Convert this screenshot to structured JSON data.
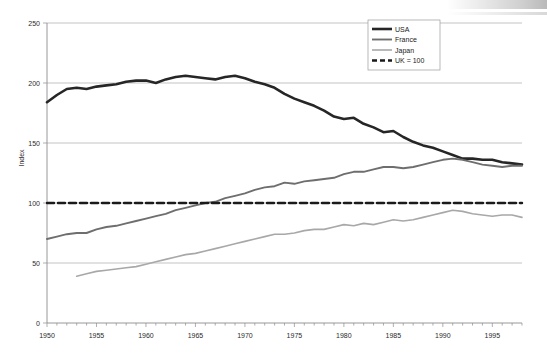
{
  "chart_data": {
    "type": "line",
    "title": "",
    "xlabel": "",
    "ylabel": "Index",
    "xlim": [
      1950,
      1998
    ],
    "ylim": [
      0,
      250
    ],
    "grid": true,
    "y_ticks": [
      0,
      50,
      100,
      150,
      200,
      250
    ],
    "x_ticks": [
      1950,
      1955,
      1960,
      1965,
      1970,
      1975,
      1980,
      1985,
      1990,
      1995
    ],
    "x_tick_interval_minor": 1,
    "legend_position": "top-right",
    "legend": [
      "USA",
      "France",
      "Japan",
      "UK = 100"
    ],
    "series": [
      {
        "name": "USA",
        "color": "#262626",
        "width": 2.6,
        "dash": "none",
        "x": [
          1950,
          1951,
          1952,
          1953,
          1954,
          1955,
          1956,
          1957,
          1958,
          1959,
          1960,
          1961,
          1962,
          1963,
          1964,
          1965,
          1966,
          1967,
          1968,
          1969,
          1970,
          1971,
          1972,
          1973,
          1974,
          1975,
          1976,
          1977,
          1978,
          1979,
          1980,
          1981,
          1982,
          1983,
          1984,
          1985,
          1986,
          1987,
          1988,
          1989,
          1990,
          1991,
          1992,
          1993,
          1994,
          1995,
          1996,
          1997,
          1998
        ],
        "values": [
          184,
          190,
          195,
          196,
          195,
          197,
          198,
          199,
          201,
          202,
          202,
          200,
          203,
          205,
          206,
          205,
          204,
          203,
          205,
          206,
          204,
          201,
          199,
          196,
          191,
          187,
          184,
          181,
          177,
          172,
          170,
          171,
          166,
          163,
          159,
          160,
          155,
          151,
          148,
          146,
          143,
          140,
          137,
          137,
          136,
          136,
          134,
          133,
          132
        ],
        "y_note": "index with UK = 100"
      },
      {
        "name": "France",
        "color": "#6e6e6e",
        "width": 1.9,
        "dash": "none",
        "x": [
          1950,
          1951,
          1952,
          1953,
          1954,
          1955,
          1956,
          1957,
          1958,
          1959,
          1960,
          1961,
          1962,
          1963,
          1964,
          1965,
          1966,
          1967,
          1968,
          1969,
          1970,
          1971,
          1972,
          1973,
          1974,
          1975,
          1976,
          1977,
          1978,
          1979,
          1980,
          1981,
          1982,
          1983,
          1984,
          1985,
          1986,
          1987,
          1988,
          1989,
          1990,
          1991,
          1992,
          1993,
          1994,
          1995,
          1996,
          1997,
          1998
        ],
        "values": [
          70,
          72,
          74,
          75,
          75,
          78,
          80,
          81,
          83,
          85,
          87,
          89,
          91,
          94,
          96,
          98,
          100,
          101,
          104,
          106,
          108,
          111,
          113,
          114,
          117,
          116,
          118,
          119,
          120,
          121,
          124,
          126,
          126,
          128,
          130,
          130,
          129,
          130,
          132,
          134,
          136,
          137,
          136,
          134,
          132,
          131,
          130,
          131,
          131
        ],
        "y_note": "index with UK = 100"
      },
      {
        "name": "Japan",
        "color": "#a8a8a8",
        "width": 1.6,
        "dash": "none",
        "x": [
          1953,
          1954,
          1955,
          1956,
          1957,
          1958,
          1959,
          1960,
          1961,
          1962,
          1963,
          1964,
          1965,
          1966,
          1967,
          1968,
          1969,
          1970,
          1971,
          1972,
          1973,
          1974,
          1975,
          1976,
          1977,
          1978,
          1979,
          1980,
          1981,
          1982,
          1983,
          1984,
          1985,
          1986,
          1987,
          1988,
          1989,
          1990,
          1991,
          1992,
          1993,
          1994,
          1995,
          1996,
          1997,
          1998
        ],
        "values": [
          39,
          41,
          43,
          44,
          45,
          46,
          47,
          49,
          51,
          53,
          55,
          57,
          58,
          60,
          62,
          64,
          66,
          68,
          70,
          72,
          74,
          74,
          75,
          77,
          78,
          78,
          80,
          82,
          81,
          83,
          82,
          84,
          86,
          85,
          86,
          88,
          90,
          92,
          94,
          93,
          91,
          90,
          89,
          90,
          90,
          88
        ],
        "y_note": "index with UK = 100"
      },
      {
        "name": "UK = 100",
        "color": "#1a1a1a",
        "width": 2.4,
        "dash": "7,4",
        "x": [
          1950,
          1998
        ],
        "values": [
          100,
          100
        ],
        "y_note": "reference baseline"
      }
    ]
  },
  "axis": {
    "y_title": "Index",
    "y_tick_labels": [
      "0",
      "50",
      "100",
      "150",
      "200",
      "250"
    ],
    "x_tick_labels": [
      "1950",
      "1955",
      "1960",
      "1965",
      "1970",
      "1975",
      "1980",
      "1985",
      "1990",
      "1995"
    ]
  },
  "legend": {
    "items": [
      {
        "label": "USA"
      },
      {
        "label": "France"
      },
      {
        "label": "Japan"
      },
      {
        "label": "UK = 100"
      }
    ]
  }
}
